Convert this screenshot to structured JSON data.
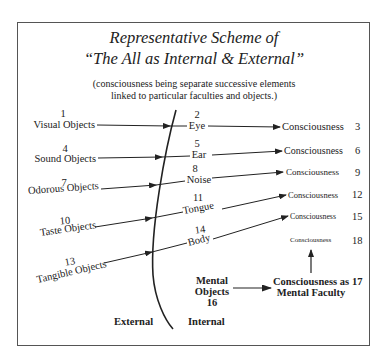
{
  "title": {
    "line1": "Representative Scheme of",
    "line2": "“The All as Internal & External”"
  },
  "subtitle": {
    "line1": "(consciousness being separate successive elements",
    "line2": "linked to particular faculties and objects.)"
  },
  "external_objects": [
    {
      "num": "1",
      "label": "Visual Objects"
    },
    {
      "num": "4",
      "label": "Sound Objects"
    },
    {
      "num": "7",
      "label": "Odorous Objects"
    },
    {
      "num": "10",
      "label": "Taste Objects"
    },
    {
      "num": "13",
      "label": "Tangible Objects"
    }
  ],
  "faculties": [
    {
      "num": "2",
      "label": "Eye"
    },
    {
      "num": "5",
      "label": "Ear"
    },
    {
      "num": "8",
      "label": "Noise"
    },
    {
      "num": "11",
      "label": "Tongue"
    },
    {
      "num": "14",
      "label": "Body"
    }
  ],
  "consciousness": [
    {
      "num": "3",
      "label": "Consciousness"
    },
    {
      "num": "6",
      "label": "Consciousness"
    },
    {
      "num": "9",
      "label": "Consciousness"
    },
    {
      "num": "12",
      "label": "Consciousness"
    },
    {
      "num": "15",
      "label": "Consciousness"
    },
    {
      "num": "18",
      "label": "Consciousness"
    }
  ],
  "mental": {
    "objects_line1": "Mental",
    "objects_line2": "Objects",
    "objects_num": "16",
    "faculty_line1": "Consciousness as",
    "faculty_line2": "Mental Faculty",
    "faculty_num": "17"
  },
  "regions": {
    "external": "External",
    "internal": "Internal"
  }
}
